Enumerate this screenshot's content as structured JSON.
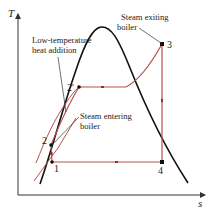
{
  "diagram": {
    "axes": {
      "y_label": "T",
      "x_label": "s"
    },
    "colors": {
      "dome": "#111111",
      "cycle": "#b5524f",
      "axis": "#333333",
      "leader": "#333333"
    },
    "points": [
      {
        "id": "1",
        "label": "1"
      },
      {
        "id": "2",
        "label": "2"
      },
      {
        "id": "2p",
        "label": "2'"
      },
      {
        "id": "3",
        "label": "3"
      },
      {
        "id": "4",
        "label": "4"
      }
    ],
    "annotations": {
      "low_temp_line1": "Low-temperature",
      "low_temp_line2": "heat addition",
      "exit_line1": "Steam exiting",
      "exit_line2": "boiler",
      "enter_line1": "Steam entering",
      "enter_line2": "boiler"
    }
  }
}
